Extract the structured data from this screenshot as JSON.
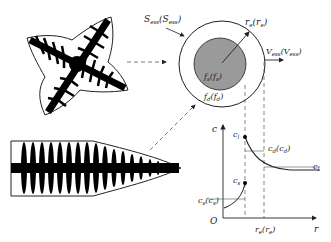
{
  "diagram": {
    "colors": {
      "line": "#222222",
      "dendrite_fill": "#000000",
      "inner_circle_fill": "#9a9a9a",
      "dashed": "#555555",
      "background": "#ffffff"
    },
    "labels": {
      "outer_surface": "S",
      "outer_surface_sub": "ess",
      "outer_surface_sup": "s",
      "outer_surface_paren": "(S",
      "outer_surface_paren_sub": "ess",
      "outer_surface_paren_sup": "s",
      "radius": "r",
      "radius_sub": "e",
      "radius_paren": "(r",
      "radius_paren_sub": "e",
      "velocity": "V",
      "velocity_sub": "ess",
      "velocity_sup": "0",
      "velocity_paren": "(V",
      "velocity_paren_sub": "ess",
      "velocity_paren_sup": "0",
      "inner_fraction": "f",
      "inner_fraction_sub": "s",
      "inner_fraction_sup": "e",
      "outer_fraction": "f",
      "outer_fraction_sub": "d",
      "outer_fraction_sup": "e"
    },
    "plot": {
      "y_axis_label": "c",
      "x_axis_label": "r",
      "origin_label": "O",
      "x_tick_label": "r",
      "x_tick_sub": "e",
      "points": {
        "cl_star": "c",
        "cl_star_sub": "l",
        "cl_star_sup": "*",
        "cs_star": "c",
        "cs_star_sub": "s",
        "cs_star_sup": "*",
        "cd": "c",
        "cd_sub": "d",
        "cd_sup": "e",
        "cs": "c",
        "cs_sub": "s",
        "cs_sup": "e",
        "cl": "c",
        "cl_sub": "l"
      }
    }
  }
}
